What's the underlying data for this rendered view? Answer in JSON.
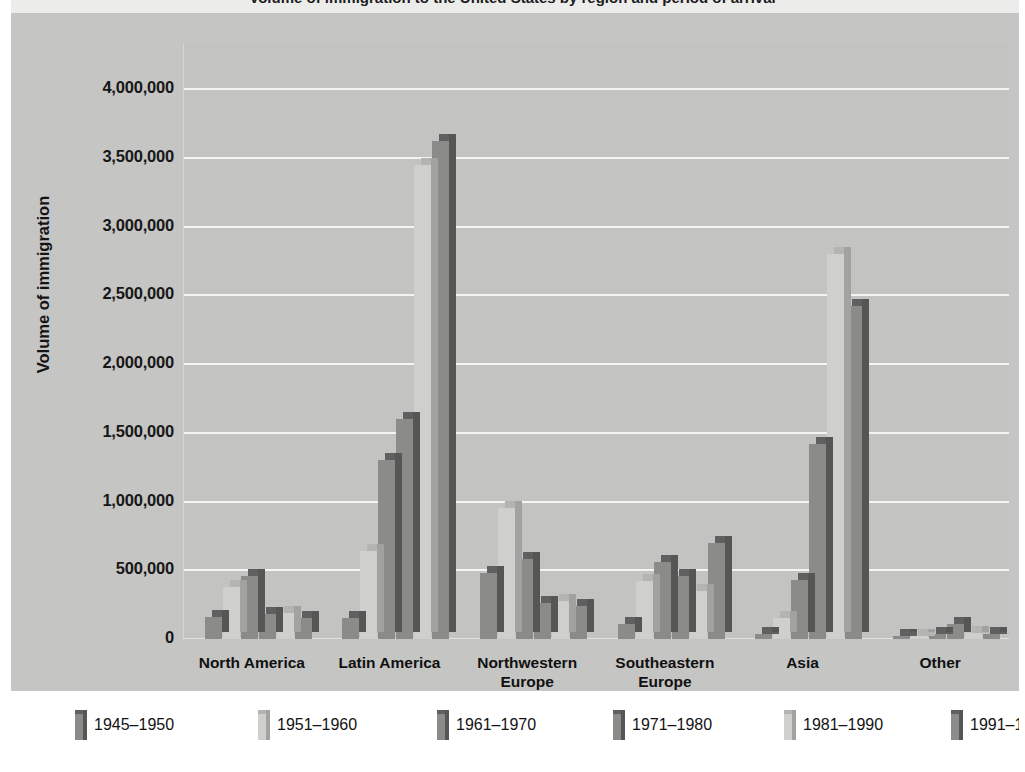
{
  "figure": {
    "title": "Volume of immigration to the United States by region and period of arrival",
    "y_axis_title": "Volume of immigration"
  },
  "colors": {
    "panel_bg": "#c5c5c4",
    "plot_bg": "#c3c3c2",
    "gridline": "#f4f4f2",
    "legend_bg": "#ffffff",
    "bar_dark_face": "#8b8b8a",
    "bar_dark_side": "#565655",
    "bar_dark_top": "#606060",
    "bar_light_face": "#cfcfcd",
    "bar_light_side": "#a2a2a0",
    "bar_light_top": "#b4b4b2",
    "text": "#131313"
  },
  "y_ticks": [
    "4,000,000",
    "3,500,000",
    "3,000,000",
    "2,500,000",
    "2,000,000",
    "1,500,000",
    "1,000,000",
    "500,000",
    "0"
  ],
  "x_categories": [
    "North America",
    "Latin America",
    "Northwestern\nEurope",
    "Southeastern\nEurope",
    "Asia",
    "Other"
  ],
  "legend": {
    "items": [
      {
        "label": "1945–1950",
        "tone": "dark"
      },
      {
        "label": "1951–1960",
        "tone": "light"
      },
      {
        "label": "1961–1970",
        "tone": "dark"
      },
      {
        "label": "1971–1980",
        "tone": "dark"
      },
      {
        "label": "1981–1990",
        "tone": "light"
      },
      {
        "label": "1991–1998",
        "tone": "dark"
      }
    ]
  },
  "chart_data": {
    "type": "bar",
    "title": "Volume of immigration to the United States by region and period of arrival",
    "xlabel": "",
    "ylabel": "Volume of immigration",
    "ylim": [
      0,
      4000000
    ],
    "ytick_step": 500000,
    "grid": true,
    "legend_position": "bottom",
    "style": "3d-clustered-column",
    "categories": [
      "North America",
      "Latin America",
      "Northwestern Europe",
      "Southeastern Europe",
      "Asia",
      "Other"
    ],
    "series": [
      {
        "name": "1945–1950",
        "tone": "dark",
        "values": [
          160000,
          150000,
          480000,
          110000,
          35000,
          20000
        ]
      },
      {
        "name": "1951–1960",
        "tone": "light",
        "values": [
          380000,
          640000,
          950000,
          420000,
          150000,
          25000
        ]
      },
      {
        "name": "1961–1970",
        "tone": "dark",
        "values": [
          460000,
          1300000,
          580000,
          560000,
          430000,
          40000
        ]
      },
      {
        "name": "1971–1980",
        "tone": "dark",
        "values": [
          180000,
          1600000,
          260000,
          460000,
          1420000,
          110000
        ]
      },
      {
        "name": "1981–1990",
        "tone": "light",
        "values": [
          190000,
          3450000,
          280000,
          350000,
          2800000,
          45000
        ]
      },
      {
        "name": "1991–1998",
        "tone": "dark",
        "values": [
          150000,
          3620000,
          240000,
          700000,
          2420000,
          40000
        ]
      }
    ]
  }
}
